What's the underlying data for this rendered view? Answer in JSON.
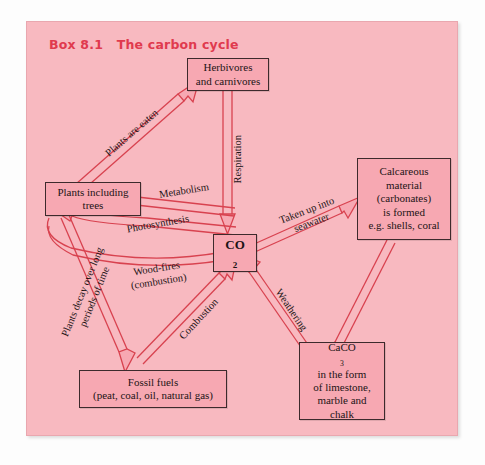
{
  "box": {
    "title": "Box 8.1   The carbon cycle",
    "panel_color": "#f8b9c0",
    "title_color": "#e03a4e",
    "node_fill": "#f7a8b2",
    "node_border": "#3d2a2c",
    "arrow_color": "#d8424f"
  },
  "diagram": {
    "type": "flow-diagram",
    "nodes": [
      {
        "id": "herbivores",
        "label": "Herbivores\nand carnivores",
        "lines": [
          "Herbivores",
          "and carnivores"
        ]
      },
      {
        "id": "plants",
        "label": "Plants including\ntrees",
        "lines": [
          "Plants including",
          "trees"
        ]
      },
      {
        "id": "co2",
        "label": "CO2",
        "lines": [
          "CO",
          "2"
        ]
      },
      {
        "id": "calcareous",
        "label": "Calcareous material (carbonates) is formed e.g. shells, coral",
        "lines": [
          "Calcareous",
          "material",
          "(carbonates)",
          "is formed",
          "e.g. shells, coral"
        ]
      },
      {
        "id": "caco3",
        "label": "CaCO3 in the form of limestone, marble and chalk",
        "lines": [
          "CaCO",
          "3",
          "in the form",
          "of limestone,",
          "marble and",
          "chalk"
        ]
      },
      {
        "id": "fossil",
        "label": "Fossil fuels (peat, coal, oil, natural gas)",
        "lines": [
          "Fossil fuels",
          "(peat, coal, oil, natural gas)"
        ]
      }
    ],
    "edges": [
      {
        "id": "plants-eaten",
        "from": "plants",
        "to": "herbivores",
        "label": "Plants are eaten"
      },
      {
        "id": "respiration",
        "from": "herbivores",
        "to": "co2",
        "label": "Respiration"
      },
      {
        "id": "metabolism",
        "from": "co2",
        "to": "plants",
        "label": "Metabolism"
      },
      {
        "id": "photosynthesis",
        "from": "co2",
        "to": "plants",
        "label": "Photosynthesis"
      },
      {
        "id": "wood-fires",
        "from": "plants",
        "to": "co2",
        "label": "Wood-fires\n(combustion)",
        "lines": [
          "Wood-fires",
          "(combustion)"
        ]
      },
      {
        "id": "taken-up",
        "from": "co2",
        "to": "calcareous",
        "label": "Taken up into\nseawater",
        "lines": [
          "Taken up into",
          "seawater"
        ]
      },
      {
        "id": "weathering",
        "from": "caco3",
        "to": "co2",
        "label": "Weathering"
      },
      {
        "id": "combustion",
        "from": "fossil",
        "to": "co2",
        "label": "Combustion"
      },
      {
        "id": "plants-decay",
        "from": "plants",
        "to": "fossil",
        "label": "Plants decay over long\nperiods of time",
        "lines": [
          "Plants decay over long",
          "periods of time"
        ]
      },
      {
        "id": "calcareous-caco3",
        "from": "calcareous",
        "to": "caco3",
        "label": ""
      }
    ],
    "labels": {
      "plants_are_eaten": "Plants are eaten",
      "respiration": "Respiration",
      "metabolism": "Metabolism",
      "photosynthesis": "Photosynthesis",
      "wood_fires_1": "Wood-fires",
      "wood_fires_2": "(combustion)",
      "taken_up_1": "Taken up into",
      "taken_up_2": "seawater",
      "weathering": "Weathering",
      "combustion": "Combustion",
      "decay_1": "Plants decay over long",
      "decay_2": "periods of time"
    },
    "node_text": {
      "herb_1": "Herbivores",
      "herb_2": "and carnivores",
      "plants_1": "Plants including",
      "plants_2": "trees",
      "co2_main": "CO",
      "co2_sub": "2",
      "calc_1": "Calcareous",
      "calc_2": "material",
      "calc_3": "(carbonates)",
      "calc_4": "is formed",
      "calc_5": "e.g. shells, coral",
      "caco3_main": "CaCO",
      "caco3_sub": "3",
      "caco3_2": "in the form",
      "caco3_3": "of limestone,",
      "caco3_4": "marble and",
      "caco3_5": "chalk",
      "fossil_1": "Fossil fuels",
      "fossil_2": "(peat, coal, oil, natural gas)"
    }
  }
}
